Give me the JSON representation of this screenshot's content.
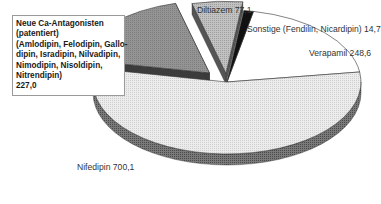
{
  "chart_data": {
    "type": "pie",
    "title": "",
    "style": "3d-exploded",
    "unit": "",
    "total": 1267.5,
    "slices": [
      {
        "label": "Nifedipin",
        "value": 700.1,
        "display": "Nifedipin 700,1",
        "fill": "#e4e4e4",
        "side": "#6b6b6b",
        "exploded": false
      },
      {
        "label": "Neue Ca-Antagonisten (patentiert) (Amlodipin, Felodipin, Gallopamil, Isradipin, Nilvadipin, Nimodipin, Nisoldipin, Nitrendipin)",
        "value": 227.0,
        "display": "227,0",
        "fill": "#8c8c8c",
        "side": "#3c3c3c",
        "exploded": true
      },
      {
        "label": "Diltiazem",
        "value": 77.1,
        "display": "Diltiazem 77,1",
        "fill": "#b4b4b4",
        "side": "#555555",
        "exploded": true
      },
      {
        "label": "Sonstige (Fendilin, Nicardipin)",
        "value": 14.7,
        "display": "Sonstige (Fendilin, Nicardipin) 14,7",
        "fill": "#111111",
        "side": "#000000",
        "exploded": false
      },
      {
        "label": "Verapamil",
        "value": 248.6,
        "display": "Verapamil 248,6",
        "fill": "#ffffff",
        "side": "#9a9a9a",
        "exploded": false
      }
    ],
    "legend": "none (direct labels)"
  },
  "labels": {
    "diltiazem": "Diltiazem 77,1",
    "sonstige": "Sonstige (Fendilin, Nicardipin) 14,7",
    "verapamil": "Verapamil 248,6",
    "nifedipin": "Nifedipin 700,1",
    "neue_box": {
      "lines": [
        "Neue Ca-Antagonisten",
        "(patentiert)",
        "(Amlodipin, Felodipin, Gallo-",
        "dipin, Isradipin, Nilvadipin,",
        "Nimodipin, Nisoldipin,",
        "Nitrendipin)",
        "227,0"
      ]
    }
  }
}
